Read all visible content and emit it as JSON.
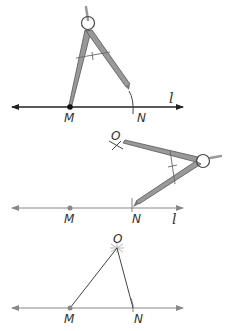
{
  "diagram": {
    "panels": [
      {
        "step": 1,
        "line_label": "l",
        "points": [
          {
            "label": "M",
            "x": 70,
            "y": 107,
            "marked": true
          },
          {
            "label": "N",
            "x": 133,
            "y": 107,
            "marked": false
          }
        ],
        "compass": {
          "hinge": [
            88,
            28
          ],
          "needle_at": "M",
          "pencil_at": "N"
        },
        "arc_at": "N"
      },
      {
        "step": 2,
        "line_label": "l",
        "points": [
          {
            "label": "M",
            "x": 70,
            "y": 208,
            "marked": true
          },
          {
            "label": "N",
            "x": 133,
            "y": 208,
            "marked": false
          },
          {
            "label": "O",
            "x": 117,
            "y": 145,
            "marked": false
          }
        ],
        "compass": {
          "hinge": [
            203,
            161
          ],
          "needle_at": "N",
          "pencil_at": "O"
        },
        "arc_at": "O"
      },
      {
        "step": 3,
        "line_label": "",
        "points": [
          {
            "label": "M",
            "x": 70,
            "y": 308,
            "marked": true
          },
          {
            "label": "N",
            "x": 133,
            "y": 308,
            "marked": false
          },
          {
            "label": "O",
            "x": 117,
            "y": 248,
            "marked": false
          }
        ],
        "segments": [
          [
            "M",
            "O"
          ],
          [
            "O",
            "N"
          ]
        ]
      }
    ],
    "labels": {
      "p1_M": "M",
      "p1_N": "N",
      "p1_l": "l",
      "p2_M": "M",
      "p2_N": "N",
      "p2_O": "O",
      "p2_l": "l",
      "p3_M": "M",
      "p3_N": "N",
      "p3_O": "O"
    },
    "colors": {
      "line_dark": "#222222",
      "line_light": "#777777",
      "compass_leg": "#8a8a8a",
      "compass_leg_edge": "#555555",
      "point": "#777777",
      "point_dark": "#111111"
    }
  }
}
